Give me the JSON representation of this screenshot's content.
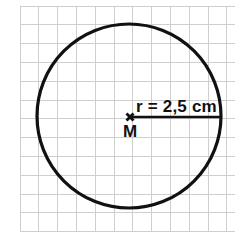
{
  "figure": {
    "background_color": "#ffffff",
    "ink_color": "#111111",
    "grid_color": "#cfcfcf",
    "labels": {
      "radius_label": "r = 2,5 cm",
      "center_label": "M"
    },
    "icons": {
      "center_marker": "cross-marker-icon"
    }
  },
  "chart_data": {
    "type": "diagram",
    "grid": {
      "visible": true,
      "left": 20,
      "top": 6,
      "right": 235,
      "bottom": 232,
      "cell_size": 18.8,
      "columns": 11,
      "rows": 12,
      "color": "#cfcfcf"
    },
    "shapes": [
      {
        "kind": "circle",
        "name": "main-circle",
        "cx": 129,
        "cy": 116,
        "r": 92,
        "stroke": "#111111",
        "stroke_width": 3.2,
        "fill": "none"
      },
      {
        "kind": "cross",
        "name": "center-marker",
        "cx": 130,
        "cy": 117,
        "size": 7,
        "stroke": "#111111"
      },
      {
        "kind": "line",
        "name": "radius-line",
        "x1": 131,
        "y1": 117,
        "x2": 221,
        "y2": 117,
        "stroke": "#111111",
        "stroke_width": 2.6
      }
    ],
    "annotations": [
      {
        "name": "radius-annotation",
        "text": "r = 2,5 cm",
        "x": 136,
        "y": 112,
        "anchor": "start",
        "font_size": 17,
        "bold": true
      },
      {
        "name": "center-annotation",
        "text": "M",
        "x": 130,
        "y": 137,
        "anchor": "middle",
        "font_size": 17,
        "bold": true
      }
    ]
  }
}
